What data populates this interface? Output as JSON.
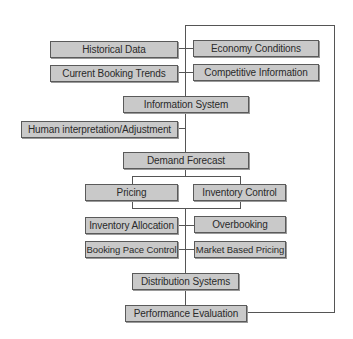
{
  "diagram": {
    "type": "flowchart",
    "title": "",
    "colors": {
      "box_fill": "#c9c9c9",
      "box_border": "#5a5a5a",
      "line": "#555555",
      "background": "#ffffff"
    },
    "nodes": [
      {
        "id": "historical_data",
        "label": "Historical Data"
      },
      {
        "id": "economy_conditions",
        "label": "Economy Conditions"
      },
      {
        "id": "current_booking_trends",
        "label": "Current Booking Trends"
      },
      {
        "id": "competitive_information",
        "label": "Competitive Information"
      },
      {
        "id": "information_system",
        "label": "Information System"
      },
      {
        "id": "human_interpretation",
        "label": "Human interpretation/Adjustment"
      },
      {
        "id": "demand_forecast",
        "label": "Demand Forecast"
      },
      {
        "id": "pricing",
        "label": "Pricing"
      },
      {
        "id": "inventory_control",
        "label": "Inventory Control"
      },
      {
        "id": "inventory_allocation",
        "label": "Inventory Allocation"
      },
      {
        "id": "overbooking",
        "label": "Overbooking"
      },
      {
        "id": "booking_pace_control",
        "label": "Booking Pace Control"
      },
      {
        "id": "market_based_pricing",
        "label": "Market Based Pricing"
      },
      {
        "id": "distribution_systems",
        "label": "Distribution Systems"
      },
      {
        "id": "performance_evaluation",
        "label": "Performance Evaluation"
      }
    ],
    "edges": [
      [
        "historical_data",
        "information_system"
      ],
      [
        "economy_conditions",
        "information_system"
      ],
      [
        "current_booking_trends",
        "information_system"
      ],
      [
        "competitive_information",
        "information_system"
      ],
      [
        "information_system",
        "demand_forecast"
      ],
      [
        "human_interpretation",
        "demand_forecast"
      ],
      [
        "demand_forecast",
        "pricing"
      ],
      [
        "demand_forecast",
        "inventory_control"
      ],
      [
        "pricing",
        "inventory_allocation"
      ],
      [
        "inventory_control",
        "inventory_allocation"
      ],
      [
        "inventory_allocation",
        "distribution_systems"
      ],
      [
        "overbooking",
        "distribution_systems"
      ],
      [
        "booking_pace_control",
        "distribution_systems"
      ],
      [
        "market_based_pricing",
        "distribution_systems"
      ],
      [
        "distribution_systems",
        "performance_evaluation"
      ],
      [
        "performance_evaluation",
        "information_system",
        "feedback loop"
      ]
    ]
  }
}
